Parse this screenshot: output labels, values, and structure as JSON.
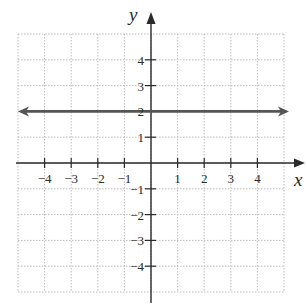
{
  "chart_data": {
    "type": "line",
    "title": "",
    "xlabel": "x",
    "ylabel": "y",
    "xlim": [
      -5,
      5
    ],
    "ylim": [
      -5,
      5
    ],
    "grid": true,
    "grid_style": "dotted",
    "x_ticks": [
      -4,
      -3,
      -2,
      -1,
      1,
      2,
      3,
      4
    ],
    "y_ticks": [
      4,
      3,
      2,
      1,
      -1,
      -2,
      -3,
      -4
    ],
    "x_tick_labels": [
      "−4",
      "−3",
      "−2",
      "−1",
      "1",
      "2",
      "3",
      "4"
    ],
    "y_tick_labels": [
      "4",
      "3",
      "2",
      "1",
      "−1",
      "−2",
      "−3",
      "−4"
    ],
    "series": [
      {
        "name": "y = 2",
        "equation": "y = 2",
        "x": [
          -5,
          5
        ],
        "y": [
          2,
          2
        ],
        "arrows_both_ends": true,
        "color": "#555555"
      }
    ],
    "legend": null
  },
  "colors": {
    "axis": "#2a2a2a",
    "grid": "#bdbdbd",
    "line": "#555555"
  }
}
